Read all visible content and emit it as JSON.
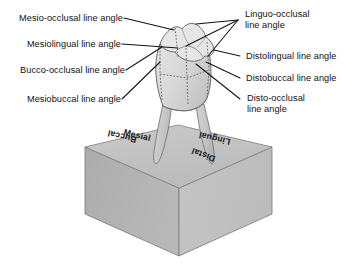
{
  "figure": {
    "background_color": "#ffffff",
    "width": 357,
    "height": 264
  },
  "labels_left": [
    {
      "id": "mesio-occlusal",
      "text": "Mesio-occlusal line angle"
    },
    {
      "id": "mesiolingual",
      "text": "Mesiolingual line angle"
    },
    {
      "id": "bucco-occlusal",
      "text": "Bucco-occlusal line angle"
    },
    {
      "id": "mesiobuccal",
      "text": "Mesiobuccal line angle"
    }
  ],
  "labels_right": [
    {
      "id": "linguo-occlusal",
      "line1": "Linguo-occlusal",
      "line2": "line angle"
    },
    {
      "id": "distolingual",
      "line1": "Distolingual line angle",
      "line2": ""
    },
    {
      "id": "distobuccal",
      "line1": "Distobuccal line angle",
      "line2": ""
    },
    {
      "id": "disto-occlusal",
      "line1": "Disto-occlusal",
      "line2": "line angle"
    }
  ],
  "cube_labels": [
    {
      "id": "mesial",
      "text": "Mesial"
    },
    {
      "id": "lingual",
      "text": "Lingual"
    },
    {
      "id": "buccal",
      "text": "Buccal"
    },
    {
      "id": "distal",
      "text": "Distal"
    }
  ],
  "colors": {
    "cube_top": "#bdbdbd",
    "cube_left": "#b2b2b2",
    "cube_right": "#c2c2c2",
    "cube_outline": "#6d6d6d",
    "tooth_crown": "#dcdcdc",
    "tooth_root": "#c9c9c9",
    "tooth_outline": "#5a5a5a",
    "leader_line": "#161616",
    "text": "#121212"
  }
}
